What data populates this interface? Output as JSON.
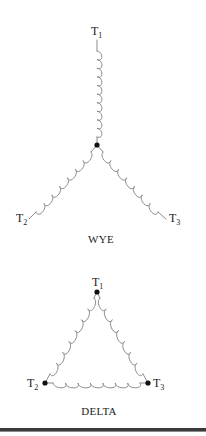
{
  "colors": {
    "coil": "#8c8c8c",
    "node": "#111111",
    "text": "#222222",
    "rule": "#3a3a3a",
    "background": "#ffffff"
  },
  "wye": {
    "caption": "WYE",
    "terminals": [
      {
        "id": "T1",
        "letter": "T",
        "sub": "1"
      },
      {
        "id": "T2",
        "letter": "T",
        "sub": "2"
      },
      {
        "id": "T3",
        "letter": "T",
        "sub": "3"
      }
    ],
    "center_node": {
      "x": 97,
      "y": 145
    },
    "coils": [
      {
        "name": "wye-coil-t1",
        "loops": 10
      },
      {
        "name": "wye-coil-t2",
        "loops": 7
      },
      {
        "name": "wye-coil-t3",
        "loops": 7
      }
    ]
  },
  "delta": {
    "caption": "DELTA",
    "terminals": [
      {
        "id": "T1",
        "letter": "T",
        "sub": "1",
        "node": {
          "x": 97,
          "y": 292
        }
      },
      {
        "id": "T2",
        "letter": "T",
        "sub": "2",
        "node": {
          "x": 45,
          "y": 383
        }
      },
      {
        "id": "T3",
        "letter": "T",
        "sub": "3",
        "node": {
          "x": 148,
          "y": 383
        }
      }
    ],
    "coils": [
      {
        "name": "delta-coil-t1-t2",
        "loops": 7
      },
      {
        "name": "delta-coil-t1-t3",
        "loops": 7
      },
      {
        "name": "delta-coil-t2-t3",
        "loops": 7
      }
    ]
  }
}
